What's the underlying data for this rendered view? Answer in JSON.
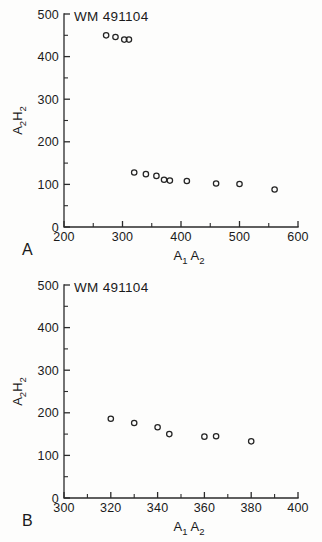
{
  "figure": {
    "background_color": "#fdfdfc",
    "ink_color": "#1a1a1a"
  },
  "chart_data": [
    {
      "type": "scatter",
      "panel_label": "A",
      "title": "WM 491104",
      "xlabel": "A₁A₂",
      "ylabel": "A₂H₂",
      "xlabel_main": "A",
      "xlabel_sub1": "1",
      "xlabel_main2": "A",
      "xlabel_sub2": "2",
      "ylabel_main": "A",
      "ylabel_sub1": "2",
      "ylabel_main2": "H",
      "ylabel_sub2": "2",
      "xlim": [
        200,
        600
      ],
      "ylim": [
        0,
        500
      ],
      "x_ticks": [
        200,
        300,
        400,
        500,
        600
      ],
      "y_ticks": [
        0,
        100,
        200,
        300,
        400,
        500
      ],
      "x_minor_step": 50,
      "y_minor_step": 50,
      "grid": false,
      "legend": "none",
      "marker": "open-circle",
      "x": [
        272,
        288,
        303,
        311,
        320,
        340,
        358,
        371,
        381,
        410,
        460,
        500,
        560
      ],
      "y": [
        450,
        446,
        440,
        440,
        128,
        124,
        120,
        111,
        109,
        108,
        102,
        101,
        88
      ]
    },
    {
      "type": "scatter",
      "panel_label": "B",
      "title": "WM 491104",
      "xlabel": "A₁A₂",
      "ylabel": "A₂H₂",
      "xlabel_main": "A",
      "xlabel_sub1": "1",
      "xlabel_main2": "A",
      "xlabel_sub2": "2",
      "ylabel_main": "A",
      "ylabel_sub1": "2",
      "ylabel_main2": "H",
      "ylabel_sub2": "2",
      "xlim": [
        300,
        400
      ],
      "ylim": [
        0,
        500
      ],
      "x_ticks": [
        300,
        320,
        340,
        360,
        380,
        400
      ],
      "y_ticks": [
        0,
        100,
        200,
        300,
        400,
        500
      ],
      "x_minor_step": 10,
      "y_minor_step": 50,
      "grid": false,
      "legend": "none",
      "marker": "open-circle",
      "x": [
        320,
        330,
        340,
        345,
        360,
        365,
        380
      ],
      "y": [
        186,
        176,
        166,
        150,
        144,
        145,
        133
      ]
    }
  ]
}
